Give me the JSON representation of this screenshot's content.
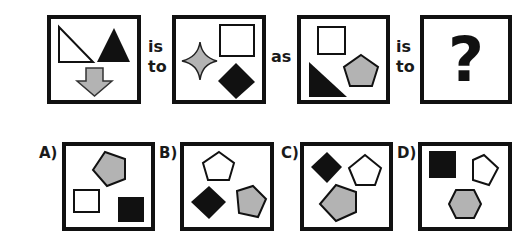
{
  "puzzle": {
    "connectors": {
      "is_to_1": [
        "is",
        "to"
      ],
      "as": "as",
      "is_to_2": [
        "is",
        "to"
      ]
    },
    "question_mark": "?",
    "colors": {
      "stroke": "#111111",
      "black_fill": "#111111",
      "gray_fill": "#b3b3b3",
      "white_fill": "#ffffff"
    },
    "panels": [
      {
        "id": "first",
        "shapes": [
          {
            "type": "right-triangle",
            "fill": "white"
          },
          {
            "type": "triangle",
            "fill": "black"
          },
          {
            "type": "down-arrow",
            "fill": "gray"
          }
        ]
      },
      {
        "id": "second",
        "shapes": [
          {
            "type": "four-point-star",
            "fill": "gray"
          },
          {
            "type": "square",
            "fill": "white"
          },
          {
            "type": "diamond",
            "fill": "black"
          }
        ]
      },
      {
        "id": "third",
        "shapes": [
          {
            "type": "square",
            "fill": "white"
          },
          {
            "type": "right-triangle",
            "fill": "black"
          },
          {
            "type": "pentagon",
            "fill": "gray"
          }
        ]
      },
      {
        "id": "unknown",
        "shapes": []
      }
    ],
    "options": [
      {
        "label": "A)",
        "shapes": [
          {
            "type": "pentagon",
            "fill": "gray"
          },
          {
            "type": "square",
            "fill": "white"
          },
          {
            "type": "square",
            "fill": "black"
          }
        ]
      },
      {
        "label": "B)",
        "shapes": [
          {
            "type": "pentagon",
            "fill": "white"
          },
          {
            "type": "diamond",
            "fill": "black"
          },
          {
            "type": "pentagon",
            "fill": "gray"
          }
        ]
      },
      {
        "label": "C)",
        "shapes": [
          {
            "type": "diamond",
            "fill": "black"
          },
          {
            "type": "pentagon",
            "fill": "white"
          },
          {
            "type": "pentagon",
            "fill": "gray"
          }
        ]
      },
      {
        "label": "D)",
        "shapes": [
          {
            "type": "square",
            "fill": "black"
          },
          {
            "type": "pentagon",
            "fill": "white"
          },
          {
            "type": "hexagon",
            "fill": "gray"
          }
        ]
      }
    ]
  }
}
